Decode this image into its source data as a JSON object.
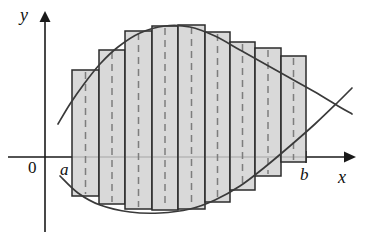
{
  "figure": {
    "background_color": "#ffffff",
    "width": 370,
    "height": 240
  },
  "axes": {
    "x_axis": {
      "name": "x-axis",
      "label": "x",
      "origin_label": "0",
      "y_pixel": 157,
      "x_start": 8,
      "x_end": 352,
      "arrow": "right"
    },
    "y_axis": {
      "name": "y-axis",
      "label": "y",
      "x_pixel": 45,
      "y_start": 232,
      "y_end": 14,
      "arrow": "up"
    },
    "ticks": [
      {
        "label": "a",
        "x_pixel": 72,
        "show_mark": false
      },
      {
        "label": "b",
        "x_pixel": 306,
        "show_mark": true
      }
    ]
  },
  "colors": {
    "axis": "#1a1a1a",
    "curve": "#3a3a3a",
    "rect_fill": "#d2d2d2",
    "rect_stroke": "#2b2b2b",
    "dash": "#7d7d7d",
    "text": "#111111"
  },
  "chart_data": {
    "type": "area",
    "xlabel": "x",
    "ylabel": "y",
    "grid": false,
    "legend": false,
    "axis_origin_label": "0",
    "interval": {
      "lower_label": "a",
      "upper_label": "b",
      "a_pixel": 72,
      "b_pixel": 306
    },
    "baseline_y_pixel": 157,
    "n_rectangles": 9,
    "rectangle_sample_rule": "midpoint",
    "categories": [
      "1",
      "2",
      "3",
      "4",
      "5",
      "6",
      "7",
      "8",
      "9"
    ],
    "rectangles": [
      {
        "index": 1,
        "x_left": 72,
        "x_right": 99,
        "y_top": 70,
        "y_bottom": 196,
        "midpoint_x": 85.5
      },
      {
        "index": 2,
        "x_left": 99,
        "x_right": 125,
        "y_top": 50,
        "y_bottom": 204,
        "midpoint_x": 112
      },
      {
        "index": 3,
        "x_left": 125,
        "x_right": 152,
        "y_top": 31,
        "y_bottom": 209,
        "midpoint_x": 138.5
      },
      {
        "index": 4,
        "x_left": 152,
        "x_right": 178,
        "y_top": 26,
        "y_bottom": 210,
        "midpoint_x": 165
      },
      {
        "index": 5,
        "x_left": 178,
        "x_right": 205,
        "y_top": 25,
        "y_bottom": 209,
        "midpoint_x": 191.5
      },
      {
        "index": 6,
        "x_left": 205,
        "x_right": 230,
        "y_top": 32,
        "y_bottom": 202,
        "midpoint_x": 217.5
      },
      {
        "index": 7,
        "x_left": 230,
        "x_right": 255,
        "y_top": 42,
        "y_bottom": 190,
        "midpoint_x": 242.5
      },
      {
        "index": 8,
        "x_left": 255,
        "x_right": 281,
        "y_top": 48,
        "y_bottom": 176,
        "midpoint_x": 268
      },
      {
        "index": 9,
        "x_left": 281,
        "x_right": 306,
        "y_top": 56,
        "y_bottom": 162,
        "midpoint_x": 293.5
      }
    ],
    "curves": [
      {
        "name": "upper-curve",
        "description": "concave curve rising from lower-left, peaking near the middle, then falling to the right",
        "points": [
          [
            58,
            124
          ],
          [
            70,
            104
          ],
          [
            84,
            84
          ],
          [
            100,
            64
          ],
          [
            118,
            47
          ],
          [
            140,
            33
          ],
          [
            165,
            26
          ],
          [
            190,
            27
          ],
          [
            215,
            36
          ],
          [
            240,
            50
          ],
          [
            265,
            64
          ],
          [
            290,
            78
          ],
          [
            315,
            92
          ],
          [
            338,
            106
          ],
          [
            352,
            114
          ]
        ]
      },
      {
        "name": "lower-curve",
        "description": "shallow curve dipping below the x-axis, rising steeply to cross the upper curve on the right",
        "points": [
          [
            60,
            176
          ],
          [
            78,
            193
          ],
          [
            100,
            205
          ],
          [
            130,
            212
          ],
          [
            160,
            213
          ],
          [
            190,
            209
          ],
          [
            215,
            200
          ],
          [
            240,
            186
          ],
          [
            265,
            167
          ],
          [
            290,
            146
          ],
          [
            315,
            124
          ],
          [
            338,
            102
          ],
          [
            352,
            88
          ]
        ]
      }
    ]
  },
  "labels": {
    "y": "y",
    "x": "x",
    "origin": "0",
    "lower_bound": "a",
    "upper_bound": "b"
  }
}
